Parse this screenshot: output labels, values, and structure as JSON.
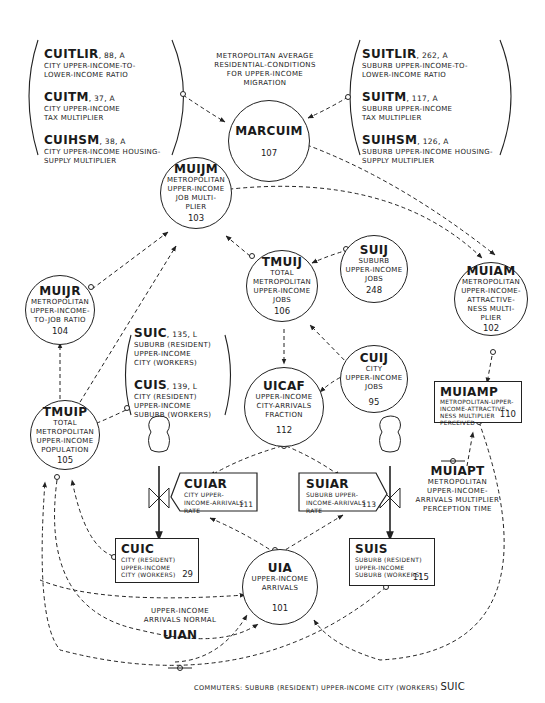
{
  "diagram": {
    "type": "system-dynamics flow diagram"
  },
  "city_constants": [
    {
      "name": "CUITLIR",
      "number": "88",
      "type": "A",
      "desc": [
        "CITY UPPER-INCOME-TO-",
        "LOWER-INCOME RATIO"
      ]
    },
    {
      "name": "CUITM",
      "number": "37",
      "type": "A",
      "desc": [
        "CITY UPPER-INCOME",
        "TAX MULTIPLIER"
      ]
    },
    {
      "name": "CUIHSM",
      "number": "38",
      "type": "A",
      "desc": [
        "CITY UPPER-INCOME HOUSING-",
        "SUPPLY MULTIPLIER"
      ]
    }
  ],
  "suburb_constants": [
    {
      "name": "SUITLIR",
      "number": "262",
      "type": "A",
      "desc": [
        "SUBURB UPPER-INCOME-TO-",
        "LOWER-INCOME RATIO"
      ]
    },
    {
      "name": "SUITM",
      "number": "117",
      "type": "A",
      "desc": [
        "SUBURB UPPER-INCOME",
        "TAX MULTIPLIER"
      ]
    },
    {
      "name": "SUIHSM",
      "number": "126",
      "type": "A",
      "desc": [
        "SUBURB UPPER-INCOME HOUSING-",
        "SUPPLY MULTIPLIER"
      ]
    }
  ],
  "commuter_constants": [
    {
      "name": "SUIC",
      "number": "135",
      "type": "L",
      "desc": [
        "SUBURB (RESIDENT)",
        "UPPER-INCOME",
        "CITY (WORKERS)"
      ]
    },
    {
      "name": "CUIS",
      "number": "139",
      "type": "L",
      "desc": [
        "CITY (RESIDENT)",
        "UPPER-INCOME",
        "SUBURB (WORKERS)"
      ]
    }
  ],
  "marcuim_caption": [
    "METROPOLITAN AVERAGE",
    "RESIDENTIAL-CONDITIONS",
    "FOR UPPER-INCOME",
    "MIGRATION"
  ],
  "nodes": {
    "marcuim": {
      "name": "MARCUIM",
      "number": "107",
      "desc": []
    },
    "muijm": {
      "name": "MUIJM",
      "number": "103",
      "desc": [
        "METROPOLITAN",
        "UPPER-INCOME",
        "JOB MULTI-",
        "PLIER"
      ]
    },
    "muijr": {
      "name": "MUIJR",
      "number": "104",
      "desc": [
        "METROPOLITAN",
        "UPPER-INCOME-",
        "TO-JOB RATIO"
      ]
    },
    "tmuij": {
      "name": "TMUIJ",
      "number": "106",
      "desc": [
        "TOTAL",
        "METROPOLITAN",
        "UPPER-INCOME",
        "JOBS"
      ]
    },
    "suij": {
      "name": "SUIJ",
      "number": "248",
      "desc": [
        "SUBURB",
        "UPPER-INCOME",
        "JOBS"
      ]
    },
    "muiam": {
      "name": "MUIAM",
      "number": "102",
      "desc": [
        "METROPOLITAN",
        "UPPER-INCOME-",
        "ATTRACTIVE-",
        "NESS MULTI-",
        "PLIER"
      ]
    },
    "uicaf": {
      "name": "UICAF",
      "number": "112",
      "desc": [
        "UPPER-INCOME",
        "CITY-ARRIVALS",
        "FRACTION"
      ]
    },
    "cuij": {
      "name": "CUIJ",
      "number": "95",
      "desc": [
        "CITY",
        "UPPER-INCOME",
        "JOBS"
      ]
    },
    "tmuip": {
      "name": "TMUIP",
      "number": "105",
      "desc": [
        "TOTAL",
        "METROPOLITAN",
        "UPPER-INCOME",
        "POPULATION"
      ]
    },
    "uia": {
      "name": "UIA",
      "number": "101",
      "desc": [
        "UPPER-INCOME",
        "ARRIVALS"
      ]
    }
  },
  "levels": {
    "muiamp": {
      "name": "MUIAMP",
      "number": "110",
      "desc": [
        "METROPOLITAN-UPPER-",
        "INCOME-ATTRACTIVE-",
        "NESS MULTIPLIER",
        "PERCEIVED"
      ]
    },
    "cuic": {
      "name": "CUIC",
      "number": "29",
      "desc": [
        "CITY (RESIDENT)",
        "UPPER-INCOME",
        "CITY (WORKERS)"
      ]
    },
    "suis": {
      "name": "SUIS",
      "number": "115",
      "desc": [
        "SUBURB (RESIDENT)",
        "UPPER-INCOME",
        "SUBURB (WORKERS)"
      ]
    }
  },
  "rates": {
    "cuiar": {
      "name": "CUIAR",
      "number": "111",
      "desc": [
        "CITY UPPER-",
        "INCOME-ARRIVALS",
        "RATE"
      ]
    },
    "suiar": {
      "name": "SUIAR",
      "number": "113",
      "desc": [
        "SUBURB UPPER-",
        "INCOME-ARRIVALS",
        "RATE"
      ]
    }
  },
  "parameters": {
    "muiapt": {
      "name": "MUIAPT",
      "desc": [
        "METROPOLITAN",
        "UPPER-INCOME-",
        "ARRIVALS MULTIPLIER",
        "PERCEPTION TIME"
      ]
    },
    "uian": {
      "name": "UIAN",
      "desc": [
        "UPPER-INCOME",
        "ARRIVALS NORMAL"
      ]
    }
  },
  "footer": {
    "text": "COMMUTERS:  SUBURB (RESIDENT) UPPER-INCOME CITY (WORKERS)",
    "abbr": "SUIC"
  },
  "colors": {
    "ink": "#222222",
    "background": "#ffffff"
  }
}
